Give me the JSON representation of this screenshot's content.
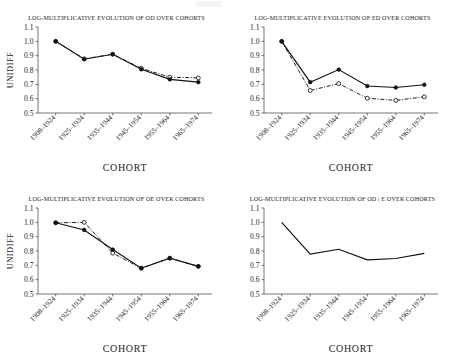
{
  "figure": {
    "background": "#ffffff",
    "line_color": "#111111",
    "axis_color": "#3d3d3d",
    "xlabel": "COHORT",
    "ylabel": "UNIDIFF",
    "categories": [
      "1908-1924",
      "1925-1934",
      "1935-1944",
      "1945-1954",
      "1955-1964",
      "1965-1974"
    ],
    "ylim": [
      0.5,
      1.1
    ],
    "yticks": [
      "1.1",
      "1.0",
      "0.9",
      "0.8",
      "0.7",
      "0.6",
      "0.5"
    ]
  },
  "chart_data": [
    {
      "type": "line",
      "panel": "top-left",
      "title": "LOG-MULTIPLICATIVE EVOLUTION OF OD OVER COHORTS",
      "xlabel": "COHORT",
      "ylabel": "UNIDIFF",
      "categories": [
        "1908-1924",
        "1925-1934",
        "1935-1944",
        "1945-1954",
        "1955-1964",
        "1965-1974"
      ],
      "ylim": [
        0.5,
        1.1
      ],
      "yticks": [
        1.1,
        1.0,
        0.9,
        0.8,
        0.7,
        0.6,
        0.5
      ],
      "grid": false,
      "legend": "none",
      "series": [
        {
          "name": "observed",
          "style": "solid",
          "marker": "filled",
          "values": [
            1.0,
            0.875,
            0.91,
            0.805,
            0.735,
            0.715
          ]
        },
        {
          "name": "fitted",
          "style": "dash-dot",
          "marker": "open",
          "values": [
            1.0,
            0.878,
            0.91,
            0.812,
            0.75,
            0.745
          ]
        }
      ]
    },
    {
      "type": "line",
      "panel": "top-right",
      "title": "LOG-MULTIPLICATIVE EVOLUTION OF ED OVER COHORTS",
      "xlabel": "COHORT",
      "ylabel": "",
      "categories": [
        "1908-1924",
        "1925-1934",
        "1935-1944",
        "1945-1954",
        "1955-1964",
        "1965-1974"
      ],
      "ylim": [
        0.5,
        1.1
      ],
      "yticks": [
        1.1,
        1.0,
        0.9,
        0.8,
        0.7,
        0.6,
        0.5
      ],
      "grid": false,
      "legend": "none",
      "series": [
        {
          "name": "observed",
          "style": "solid",
          "marker": "filled",
          "values": [
            1.0,
            0.715,
            0.803,
            0.688,
            0.678,
            0.697
          ]
        },
        {
          "name": "fitted",
          "style": "dash-dot",
          "marker": "open",
          "values": [
            1.0,
            0.657,
            0.705,
            0.603,
            0.588,
            0.613
          ]
        }
      ]
    },
    {
      "type": "line",
      "panel": "bottom-left",
      "title": "LOG-MULTIPLICATIVE EVOLUTION OF OE OVER COHORTS",
      "xlabel": "COHORT",
      "ylabel": "UNIDIFF",
      "categories": [
        "1908-1924",
        "1925-1934",
        "1935-1944",
        "1945-1954",
        "1955-1964",
        "1965-1974"
      ],
      "ylim": [
        0.5,
        1.1
      ],
      "yticks": [
        1.1,
        1.0,
        0.9,
        0.8,
        0.7,
        0.6,
        0.5
      ],
      "grid": false,
      "legend": "none",
      "series": [
        {
          "name": "observed",
          "style": "solid",
          "marker": "filled",
          "values": [
            0.997,
            0.947,
            0.81,
            0.68,
            0.75,
            0.693
          ]
        },
        {
          "name": "fitted",
          "style": "dash-dot",
          "marker": "open",
          "values": [
            0.997,
            1.0,
            0.785,
            0.68,
            0.75,
            0.693
          ]
        }
      ]
    },
    {
      "type": "line",
      "panel": "bottom-right",
      "title": "LOG-MULTIPLICATIVE EVOLUTION OF OD | E OVER COHORTS",
      "xlabel": "COHORT",
      "ylabel": "",
      "categories": [
        "1908-1924",
        "1925-1934",
        "1935-1944",
        "1945-1954",
        "1955-1964",
        "1965-1974"
      ],
      "ylim": [
        0.5,
        1.1
      ],
      "yticks": [
        1.1,
        1.0,
        0.9,
        0.8,
        0.7,
        0.6,
        0.5
      ],
      "grid": false,
      "legend": "none",
      "series": [
        {
          "name": "conditional",
          "style": "solid",
          "marker": "none",
          "values": [
            1.0,
            0.778,
            0.812,
            0.738,
            0.748,
            0.783
          ]
        }
      ]
    }
  ]
}
